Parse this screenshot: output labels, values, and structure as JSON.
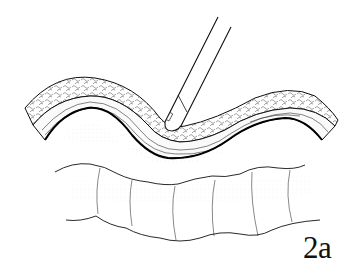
{
  "figure": {
    "label": "2a",
    "colors": {
      "ink": "#111111",
      "background": "#ffffff",
      "shading": "#9a9a9a"
    }
  }
}
